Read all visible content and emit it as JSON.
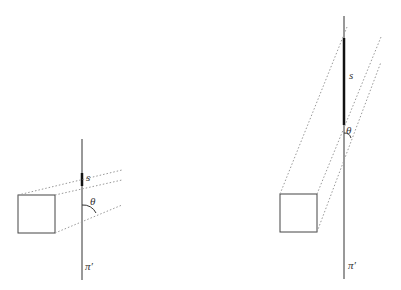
{
  "diagram": {
    "panels": [
      {
        "id": "left",
        "labels": {
          "segment": "s",
          "angle": "θ",
          "plane": "π′"
        },
        "plane_line": {
          "x": 82,
          "y1": 139,
          "y2": 280
        },
        "segment": {
          "x": 82,
          "y1": 173,
          "y2": 186
        },
        "square": {
          "x": 18,
          "y": 195,
          "w": 37,
          "h": 38
        },
        "rays": [
          {
            "x1": 18,
            "y1": 195,
            "x2": 122,
            "y2": 170
          },
          {
            "x1": 55,
            "y1": 195,
            "x2": 122,
            "y2": 180
          },
          {
            "x1": 55,
            "y1": 233,
            "x2": 122,
            "y2": 205
          }
        ]
      },
      {
        "id": "right",
        "labels": {
          "segment": "s",
          "angle": "θ",
          "plane": "π′"
        },
        "plane_line": {
          "x": 344,
          "y1": 16,
          "y2": 279
        },
        "segment": {
          "x": 344,
          "y1": 38,
          "y2": 125
        },
        "square": {
          "x": 280,
          "y": 194,
          "w": 37,
          "h": 38
        },
        "rays": [
          {
            "x1": 280,
            "y1": 194,
            "x2": 347,
            "y2": 27
          },
          {
            "x1": 317,
            "y1": 194,
            "x2": 381,
            "y2": 37
          },
          {
            "x1": 317,
            "y1": 232,
            "x2": 381,
            "y2": 62
          }
        ]
      }
    ],
    "colors": {
      "line": "#333333",
      "dotted": "#999999",
      "background": "#ffffff"
    }
  }
}
